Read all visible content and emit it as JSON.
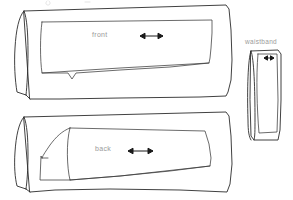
{
  "document": {
    "title": "Trouser pattern layout sketch",
    "background_color": "#ffffff",
    "line_color": "#2b2b2b",
    "label_color": "#9a9a9a",
    "width": 293,
    "height": 200
  },
  "labels": {
    "front": "front",
    "back": "back",
    "waistband": "waistband",
    "top_faint": ""
  },
  "pieces": [
    {
      "name": "front",
      "label": "front",
      "grainline": "horizontal double-headed arrow",
      "fold_side": "left"
    },
    {
      "name": "back",
      "label": "back",
      "grainline": "horizontal double-headed arrow",
      "fold_side": "left"
    },
    {
      "name": "waistband",
      "label": "waistband",
      "grainline": "short horizontal double-headed arrow",
      "fold_side": "left"
    }
  ]
}
